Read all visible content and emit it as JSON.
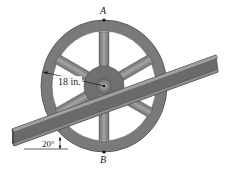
{
  "figure": {
    "type": "mechanics-diagram"
  },
  "labels": {
    "point_top": "A",
    "point_bottom": "B",
    "radius": "18 in.",
    "angle": "20°"
  },
  "geometry": {
    "radius_in": 18,
    "beam_angle_deg": 20,
    "spoke_count": 6
  },
  "colors": {
    "rim": "#7a7a7a",
    "rim_dark": "#5a5a5a",
    "spokes": "#8a8a8a",
    "hub": "#6e6e6e",
    "axle": "#a8a8a8",
    "beam": "#6a6a6a",
    "beam_flange": "#9a9a9a",
    "line": "#1a1a1a"
  }
}
